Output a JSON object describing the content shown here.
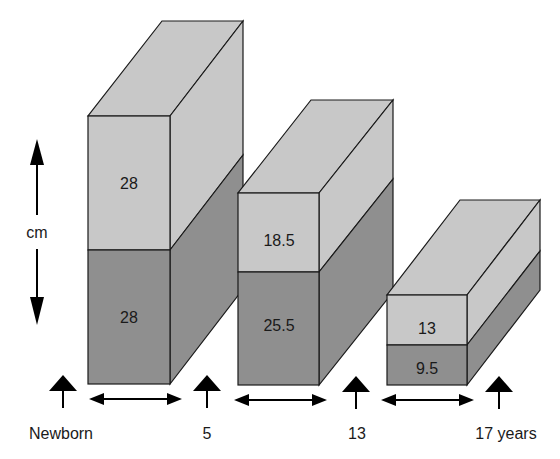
{
  "diagram": {
    "unit_label": "cm",
    "colors": {
      "upper": "#c8c8c8",
      "lower": "#8f8f8f",
      "stroke": "#1a1a1a"
    },
    "blocks": [
      {
        "age": "Newborn",
        "upper_value": "28",
        "lower_value": "28"
      },
      {
        "age": "5",
        "upper_value": "18.5",
        "lower_value": "25.5"
      },
      {
        "age": "13",
        "upper_value": "13",
        "lower_value": "9.5"
      }
    ],
    "age_labels": [
      "Newborn",
      "5",
      "13",
      "17 years"
    ]
  }
}
